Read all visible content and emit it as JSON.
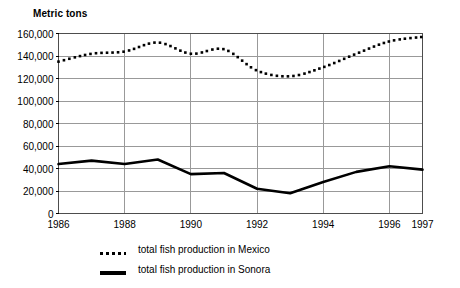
{
  "chart_data": {
    "type": "line",
    "title": "",
    "ylabel": "Metric tons",
    "xlabel": "",
    "ylim": [
      0,
      160000
    ],
    "xlim": [
      1986,
      1997
    ],
    "ytick_values": [
      0,
      20000,
      40000,
      60000,
      80000,
      100000,
      120000,
      140000,
      160000
    ],
    "ytick_labels": [
      "0",
      "20,000",
      "40,000",
      "60,000",
      "80,000",
      "100,000",
      "120,000",
      "140,000",
      "160,000"
    ],
    "xtick_values": [
      1986,
      1988,
      1990,
      1992,
      1994,
      1996,
      1997
    ],
    "xtick_labels": [
      "1986",
      "1988",
      "1990",
      "1992",
      "1994",
      "1996",
      "1997"
    ],
    "grid": true,
    "grid_color": "#999999",
    "legend_position": "below",
    "x": [
      1986,
      1987,
      1988,
      1989,
      1990,
      1991,
      1992,
      1993,
      1994,
      1995,
      1996,
      1997
    ],
    "series": [
      {
        "name": "total fish production in Mexico",
        "style": "dotted",
        "color": "#000000",
        "values": [
          135000,
          142000,
          144000,
          152000,
          142000,
          146000,
          127000,
          122000,
          130000,
          142000,
          153000,
          157000
        ]
      },
      {
        "name": "total fish production in Sonora",
        "style": "solid",
        "color": "#000000",
        "values": [
          44000,
          47000,
          44000,
          48000,
          35000,
          36000,
          22000,
          18000,
          28000,
          37000,
          42000,
          39000
        ]
      }
    ]
  },
  "legend": {
    "items": [
      {
        "label": "total fish production in Mexico",
        "marker": "dotted-line-swatch"
      },
      {
        "label": "total fish production in Sonora",
        "marker": "solid-line-swatch"
      }
    ]
  }
}
